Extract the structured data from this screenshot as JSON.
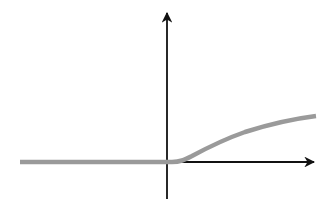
{
  "diagram": {
    "type": "function-graph",
    "colors": {
      "background": "#ffffff",
      "axis": "#111111",
      "curve": "#9a9a9a"
    },
    "axes": {
      "x_axis": {
        "from": [
          20,
          162
        ],
        "to": [
          316,
          162
        ],
        "arrow": "right"
      },
      "y_axis": {
        "from": [
          167,
          199
        ],
        "to": [
          167,
          11
        ],
        "arrow": "up"
      }
    },
    "curve": {
      "points": [
        [
          20,
          162
        ],
        [
          167,
          162
        ],
        [
          180,
          161
        ],
        [
          195,
          155
        ],
        [
          210,
          148
        ],
        [
          230,
          139
        ],
        [
          250,
          131
        ],
        [
          270,
          125
        ],
        [
          290,
          120
        ],
        [
          316,
          116
        ]
      ]
    },
    "labels": []
  }
}
